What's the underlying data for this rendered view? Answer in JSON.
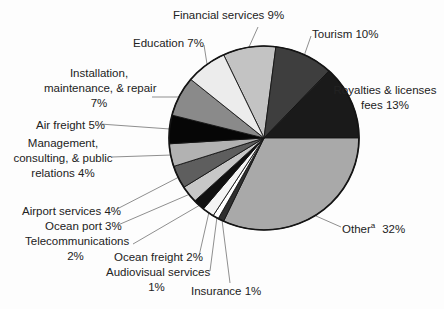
{
  "chart_data": {
    "type": "pie",
    "title": "",
    "start_angle_deg": -25.2,
    "clockwise": true,
    "legend": "none",
    "unit": "%",
    "slices": [
      {
        "name": "Financial services",
        "pct": 9,
        "color": "#c3c3c3",
        "label_lines": [
          "Financial services 9%"
        ]
      },
      {
        "name": "Tourism",
        "pct": 10,
        "color": "#3e3e3e",
        "label_lines": [
          "Tourism 10%"
        ]
      },
      {
        "name": "Royalties & licenses fees",
        "pct": 13,
        "color": "#1a1a1a",
        "label_lines": [
          "Royalties & licenses",
          "fees 13%"
        ]
      },
      {
        "name": "Other",
        "pct": 32,
        "color": "#a9a9a9",
        "label_base": "Other",
        "label_sup": "a",
        "label_rest": "32%"
      },
      {
        "name": "Insurance",
        "pct": 1,
        "color": "#2f2f2f",
        "label_lines": [
          "Insurance 1%"
        ]
      },
      {
        "name": "Audiovisual services",
        "pct": 1,
        "color": "#ffffff",
        "label_lines": [
          "Audiovisual services",
          "1%"
        ]
      },
      {
        "name": "Ocean freight",
        "pct": 2,
        "color": "#f4f4f4",
        "label_lines": [
          "Ocean freight 2%"
        ]
      },
      {
        "name": "Telecommunications",
        "pct": 2,
        "color": "#101010",
        "label_lines": [
          "Telecommunications",
          "2%"
        ]
      },
      {
        "name": "Ocean port",
        "pct": 3,
        "color": "#c7c7c7",
        "label_lines": [
          "Ocean port 3%"
        ]
      },
      {
        "name": "Airport services",
        "pct": 4,
        "color": "#5e5e5e",
        "label_lines": [
          "Airport services 4%"
        ]
      },
      {
        "name": "Management, consulting, & public relations",
        "pct": 4,
        "color": "#b2b2b2",
        "label_lines": [
          "Management,",
          "consulting, & public",
          "relations 4%"
        ]
      },
      {
        "name": "Air freight",
        "pct": 5,
        "color": "#060606",
        "label_lines": [
          "Air freight 5%"
        ]
      },
      {
        "name": "Installation, maintenance, & repair",
        "pct": 7,
        "color": "#8a8a8a",
        "label_lines": [
          "Installation,",
          "maintenance, & repair",
          "7%"
        ]
      },
      {
        "name": "Education",
        "pct": 7,
        "color": "#ececec",
        "label_lines": [
          "Education 7%"
        ]
      }
    ],
    "outline_color": "#141414",
    "leader_line_color": "#8f8f8f",
    "background_color": "#fdfdfd"
  }
}
